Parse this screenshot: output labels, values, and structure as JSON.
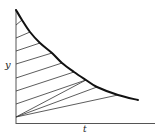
{
  "diagram": {
    "type": "decay-curve-with-hatching",
    "axes": {
      "x_label": "t",
      "y_label": "y",
      "color": "#555555"
    },
    "curve": {
      "color": "#111111",
      "points": [
        [
          16,
          10
        ],
        [
          22,
          20
        ],
        [
          30,
          32
        ],
        [
          40,
          43
        ],
        [
          52,
          53
        ],
        [
          62,
          63
        ],
        [
          74,
          72
        ],
        [
          86,
          80
        ],
        [
          97,
          87
        ],
        [
          118,
          95
        ],
        [
          138,
          100
        ]
      ]
    },
    "hatch_lines": [
      {
        "from": [
          16,
          25
        ],
        "to": [
          22,
          20
        ]
      },
      {
        "from": [
          16,
          38
        ],
        "to": [
          30,
          32
        ]
      },
      {
        "from": [
          16,
          51
        ],
        "to": [
          40,
          43
        ]
      },
      {
        "from": [
          16,
          64
        ],
        "to": [
          52,
          53
        ]
      },
      {
        "from": [
          16,
          78
        ],
        "to": [
          62,
          63
        ]
      },
      {
        "from": [
          16,
          91
        ],
        "to": [
          74,
          72
        ]
      },
      {
        "from": [
          16,
          104
        ],
        "to": [
          86,
          80
        ]
      }
    ],
    "fan_lines": [
      {
        "from": [
          16,
          117
        ],
        "to": [
          86,
          80
        ]
      },
      {
        "from": [
          16,
          117
        ],
        "to": [
          97,
          87
        ]
      },
      {
        "from": [
          16,
          117
        ],
        "to": [
          118,
          95
        ]
      }
    ],
    "line_color": "#333333"
  }
}
